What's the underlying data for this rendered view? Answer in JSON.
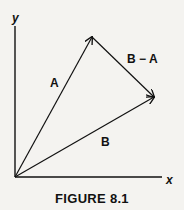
{
  "figure": {
    "caption": "FIGURE 8.1",
    "axes": {
      "x_label": "x",
      "y_label": "y"
    },
    "vectors": [
      {
        "name": "A",
        "label": "A",
        "from": "origin",
        "to": "tip of A"
      },
      {
        "name": "B",
        "label": "B",
        "from": "origin",
        "to": "tip of B"
      },
      {
        "name": "B-A",
        "label": "B − A",
        "from": "tip of A",
        "to": "tip of B"
      }
    ],
    "colors": {
      "ink": "#111111",
      "background": "#f4f3f0"
    }
  }
}
